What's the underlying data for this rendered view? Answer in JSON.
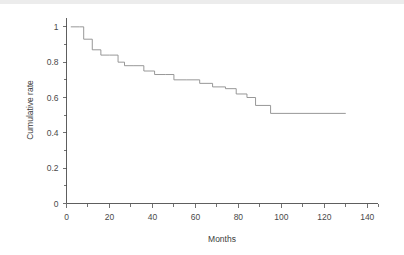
{
  "chart_data": {
    "type": "line",
    "subtype": "kaplan-meier-step",
    "title": "",
    "xlabel": "Months",
    "ylabel": "Cumulative rate",
    "xlim": [
      0,
      145
    ],
    "ylim": [
      0,
      1.05
    ],
    "grid": false,
    "legend": null,
    "xticks": [
      0,
      20,
      40,
      60,
      80,
      100,
      120,
      140
    ],
    "xtick_labels": [
      "0",
      "20",
      "40",
      "60",
      "80",
      "100",
      "120",
      "140"
    ],
    "xminor_step": 10,
    "yticks": [
      0,
      0.2,
      0.4,
      0.6,
      0.8,
      1
    ],
    "ytick_labels": [
      "0",
      "0.2",
      "0.4",
      "0.6",
      "0.8",
      "1"
    ],
    "yminor_step": 0.1,
    "series": [
      {
        "name": "Cumulative rate",
        "color": "#8c8c8c",
        "step": "post",
        "x": [
          2,
          6,
          8,
          12,
          16,
          20,
          24,
          27,
          31,
          36,
          41,
          46,
          50,
          56,
          62,
          68,
          74,
          79,
          84,
          88,
          95,
          130
        ],
        "y": [
          1.0,
          1.0,
          0.93,
          0.87,
          0.84,
          0.84,
          0.8,
          0.78,
          0.78,
          0.75,
          0.73,
          0.73,
          0.7,
          0.7,
          0.68,
          0.66,
          0.65,
          0.62,
          0.6,
          0.555,
          0.51,
          0.51
        ]
      }
    ]
  },
  "axes": {
    "x_title": "Months",
    "y_title": "Cumulative rate"
  }
}
